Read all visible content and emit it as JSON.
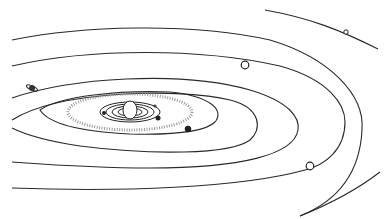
{
  "diagram": {
    "title": "",
    "type": "solar-system-orbits",
    "colors": {
      "background": "#ffffff",
      "line": "#2a2a2a",
      "belt": "#9a9a9a"
    },
    "center": {
      "x": 130,
      "y": 110
    },
    "sun": {
      "name": "sun",
      "rx": 10,
      "ry": 12
    },
    "inner_orbits": [
      {
        "rx": 16,
        "ry": 6
      },
      {
        "rx": 24,
        "ry": 9
      },
      {
        "rx": 32,
        "ry": 12
      },
      {
        "rx": 40,
        "ry": 15
      }
    ],
    "asteroid_belt": {
      "rx": 62,
      "ry": 24
    },
    "outer_orbits": [
      {
        "rx": 78,
        "ry": 36
      },
      {
        "rx": 118,
        "ry": 55
      },
      {
        "rx": 165,
        "ry": 80
      },
      {
        "rx": 225,
        "ry": 108
      },
      {
        "rx": 290,
        "ry": 150
      }
    ],
    "planets": [
      {
        "name": "mercury",
        "x": 102,
        "y": 112,
        "r": 2
      },
      {
        "name": "venus",
        "x": 156,
        "y": 104,
        "r": 2
      },
      {
        "name": "earth",
        "x": 158,
        "y": 118,
        "r": 3
      },
      {
        "name": "mars",
        "x": 188,
        "y": 129,
        "r": 3
      },
      {
        "name": "jupiter",
        "x": 245,
        "y": 65,
        "r": 4
      },
      {
        "name": "saturn",
        "x": 32,
        "y": 88,
        "r": 4
      },
      {
        "name": "uranus",
        "x": 310,
        "y": 166,
        "r": 4
      },
      {
        "name": "neptune",
        "x": 346,
        "y": 32,
        "r": 2.5
      }
    ]
  }
}
